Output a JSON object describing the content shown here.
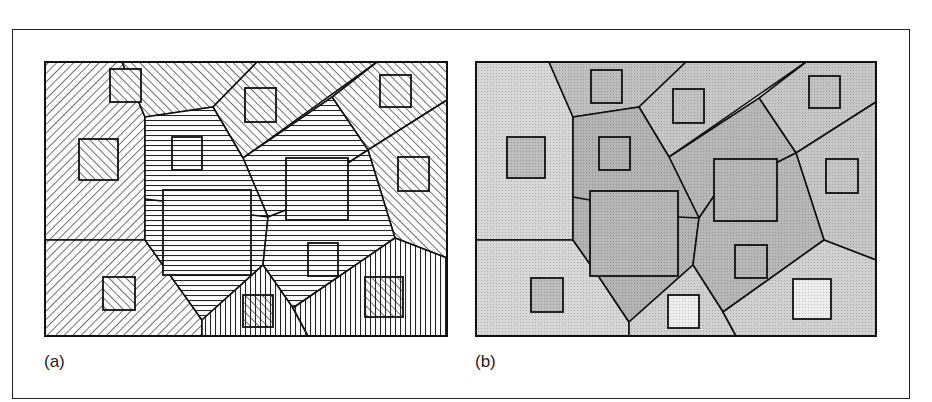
{
  "figure": {
    "panels": [
      {
        "id": "a",
        "label": "(a)",
        "style": "hatch",
        "map": {
          "x": 45,
          "y": 62,
          "w": 402,
          "h": 274
        }
      },
      {
        "id": "b",
        "label": "(b)",
        "style": "shade",
        "map": {
          "x": 476,
          "y": 62,
          "w": 400,
          "h": 274
        }
      }
    ]
  },
  "diagram": {
    "a": {
      "cells": [
        {
          "fill": "slash",
          "points": [
            [
              45,
              62
            ],
            [
              122,
              62
            ],
            [
              145,
              117
            ],
            [
              145,
              240
            ],
            [
              45,
              240
            ]
          ]
        },
        {
          "fill": "slash",
          "points": [
            [
              45,
              240
            ],
            [
              145,
              240
            ],
            [
              202,
              320
            ],
            [
              202,
              336
            ],
            [
              45,
              336
            ]
          ]
        },
        {
          "fill": "back",
          "points": [
            [
              122,
              62
            ],
            [
              257,
              62
            ],
            [
              213,
              107
            ],
            [
              145,
              117
            ]
          ]
        },
        {
          "fill": "back",
          "points": [
            [
              257,
              62
            ],
            [
              377,
              62
            ],
            [
              243,
              158
            ],
            [
              213,
              107
            ]
          ]
        },
        {
          "fill": "back",
          "points": [
            [
              377,
              62
            ],
            [
              447,
              62
            ],
            [
              447,
              100
            ],
            [
              368,
              150
            ],
            [
              332,
              97
            ]
          ]
        },
        {
          "fill": "horiz",
          "points": [
            [
              332,
              97
            ],
            [
              368,
              150
            ],
            [
              348,
              163
            ],
            [
              286,
              210
            ],
            [
              268,
              217
            ],
            [
              243,
              158
            ]
          ]
        },
        {
          "fill": "back",
          "points": [
            [
              368,
              150
            ],
            [
              447,
              100
            ],
            [
              447,
              258
            ],
            [
              395,
              238
            ]
          ]
        },
        {
          "fill": "horiz",
          "points": [
            [
              145,
              117
            ],
            [
              213,
              107
            ],
            [
              243,
              158
            ],
            [
              268,
              217
            ],
            [
              263,
              265
            ],
            [
              202,
              320
            ],
            [
              145,
              240
            ]
          ]
        },
        {
          "fill": "horiz",
          "points": [
            [
              268,
              217
            ],
            [
              286,
              210
            ],
            [
              348,
              163
            ],
            [
              368,
              150
            ],
            [
              395,
              238
            ],
            [
              293,
              308
            ],
            [
              263,
              265
            ]
          ]
        },
        {
          "fill": "vert",
          "points": [
            [
              202,
              320
            ],
            [
              263,
              265
            ],
            [
              293,
              308
            ],
            [
              308,
              336
            ],
            [
              202,
              336
            ]
          ]
        },
        {
          "fill": "vert",
          "points": [
            [
              293,
              308
            ],
            [
              395,
              238
            ],
            [
              447,
              258
            ],
            [
              447,
              336
            ],
            [
              308,
              336
            ]
          ]
        }
      ],
      "squares": [
        {
          "x": 110,
          "y": 69,
          "w": 31,
          "h": 33,
          "fill": "back"
        },
        {
          "x": 245,
          "y": 88,
          "w": 31,
          "h": 34,
          "fill": "back"
        },
        {
          "x": 380,
          "y": 75,
          "w": 31,
          "h": 32,
          "fill": "back"
        },
        {
          "x": 79,
          "y": 139,
          "w": 39,
          "h": 41,
          "fill": "back"
        },
        {
          "x": 172,
          "y": 137,
          "w": 30,
          "h": 33,
          "fill": "horiz"
        },
        {
          "x": 398,
          "y": 157,
          "w": 31,
          "h": 34,
          "fill": "back"
        },
        {
          "x": 163,
          "y": 190,
          "w": 88,
          "h": 85,
          "fill": "horiz"
        },
        {
          "x": 286,
          "y": 158,
          "w": 62,
          "h": 62,
          "fill": "horiz"
        },
        {
          "x": 308,
          "y": 243,
          "w": 30,
          "h": 33,
          "fill": "horiz"
        },
        {
          "x": 103,
          "y": 277,
          "w": 32,
          "h": 33,
          "fill": "back"
        },
        {
          "x": 243,
          "y": 295,
          "w": 30,
          "h": 32,
          "fill": "cross"
        },
        {
          "x": 365,
          "y": 277,
          "w": 38,
          "h": 40,
          "fill": "cross"
        }
      ],
      "edges": [
        [
          [
            145,
            199
          ],
          [
            162,
            201
          ]
        ],
        [
          [
            252,
            215
          ],
          [
            268,
            217
          ]
        ]
      ]
    },
    "b": {
      "cells": [
        {
          "fill": "#d9d9d9",
          "points": [
            [
              476,
              62
            ],
            [
              549,
              62
            ],
            [
              573,
              117
            ],
            [
              573,
              240
            ],
            [
              476,
              240
            ]
          ]
        },
        {
          "fill": "#d9d9d9",
          "points": [
            [
              476,
              240
            ],
            [
              573,
              240
            ],
            [
              599,
              277
            ],
            [
              629,
              322
            ],
            [
              629,
              336
            ],
            [
              476,
              336
            ]
          ]
        },
        {
          "fill": "#c2c2c2",
          "points": [
            [
              549,
              62
            ],
            [
              686,
              62
            ],
            [
              639,
              107
            ],
            [
              573,
              117
            ]
          ]
        },
        {
          "fill": "#c8c8c8",
          "points": [
            [
              686,
              62
            ],
            [
              806,
              62
            ],
            [
              669,
              157
            ],
            [
              639,
              107
            ]
          ]
        },
        {
          "fill": "#c8c8c8",
          "points": [
            [
              806,
              62
            ],
            [
              876,
              62
            ],
            [
              876,
              102
            ],
            [
              796,
              153
            ],
            [
              759,
              98
            ]
          ]
        },
        {
          "fill": "#b9b9b9",
          "points": [
            [
              759,
              98
            ],
            [
              796,
              153
            ],
            [
              776,
              163
            ],
            [
              714,
              196
            ],
            [
              699,
              218
            ],
            [
              669,
              157
            ]
          ]
        },
        {
          "fill": "#c8c8c8",
          "points": [
            [
              796,
              153
            ],
            [
              876,
              102
            ],
            [
              876,
              260
            ],
            [
              824,
              240
            ]
          ]
        },
        {
          "fill": "#b5b5b5",
          "points": [
            [
              573,
              117
            ],
            [
              639,
              107
            ],
            [
              669,
              157
            ],
            [
              699,
              218
            ],
            [
              693,
              265
            ],
            [
              629,
              322
            ],
            [
              599,
              277
            ],
            [
              573,
              240
            ]
          ]
        },
        {
          "fill": "#b9b9b9",
          "points": [
            [
              699,
              218
            ],
            [
              714,
              196
            ],
            [
              776,
              163
            ],
            [
              796,
              153
            ],
            [
              824,
              240
            ],
            [
              723,
              312
            ],
            [
              693,
              265
            ]
          ]
        },
        {
          "fill": "#d2d2d2",
          "points": [
            [
              629,
              322
            ],
            [
              693,
              265
            ],
            [
              723,
              312
            ],
            [
              736,
              336
            ],
            [
              629,
              336
            ]
          ]
        },
        {
          "fill": "#d2d2d2",
          "points": [
            [
              723,
              312
            ],
            [
              824,
              240
            ],
            [
              876,
              260
            ],
            [
              876,
              336
            ],
            [
              736,
              336
            ]
          ]
        }
      ],
      "squares": [
        {
          "x": 591,
          "y": 70,
          "w": 31,
          "h": 33,
          "fill": "#bdbdbd"
        },
        {
          "x": 673,
          "y": 89,
          "w": 31,
          "h": 34,
          "fill": "#c4c4c4"
        },
        {
          "x": 809,
          "y": 76,
          "w": 31,
          "h": 32,
          "fill": "#c4c4c4"
        },
        {
          "x": 507,
          "y": 137,
          "w": 38,
          "h": 41,
          "fill": "#c0c0c0"
        },
        {
          "x": 599,
          "y": 137,
          "w": 31,
          "h": 33,
          "fill": "#b5b5b5"
        },
        {
          "x": 826,
          "y": 159,
          "w": 32,
          "h": 34,
          "fill": "#c8c8c8"
        },
        {
          "x": 590,
          "y": 191,
          "w": 88,
          "h": 85,
          "fill": "#b8b8b8"
        },
        {
          "x": 714,
          "y": 159,
          "w": 63,
          "h": 62,
          "fill": "#b9b9b9"
        },
        {
          "x": 735,
          "y": 245,
          "w": 32,
          "h": 33,
          "fill": "#b9b9b9"
        },
        {
          "x": 531,
          "y": 278,
          "w": 32,
          "h": 34,
          "fill": "#c0c0c0"
        },
        {
          "x": 668,
          "y": 295,
          "w": 31,
          "h": 33,
          "fill": "#f0f0f0"
        },
        {
          "x": 793,
          "y": 279,
          "w": 38,
          "h": 40,
          "fill": "#f0f0f0"
        }
      ],
      "edges": [
        [
          [
            573,
            197
          ],
          [
            590,
            200
          ]
        ],
        [
          [
            678,
            217
          ],
          [
            699,
            218
          ]
        ]
      ]
    }
  }
}
